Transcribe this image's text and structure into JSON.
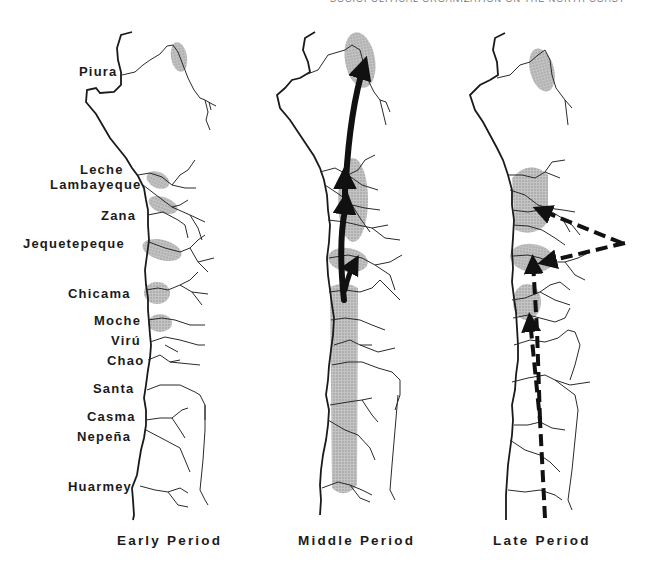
{
  "header": {
    "running_head": "SOCIOPOLITICAL ORGANIZATION ON THE NORTH COAST"
  },
  "map_panels": [
    {
      "id": "early",
      "label": "Early Period",
      "arrows": "none",
      "shaded_areas": [
        "Piura (upper valley)",
        "Leche",
        "Lambayeque",
        "Jequetepeque",
        "Chicama",
        "Moche"
      ]
    },
    {
      "id": "middle",
      "label": "Middle Period",
      "arrows": "solid, northward from Moche/Chicama to Jequetepeque, Lambayeque and Piura",
      "shaded_areas": [
        "Piura (upper valley)",
        "Lambayeque-Zana",
        "Jequetepeque",
        "Chicama through Huarmey (continuous strip)"
      ]
    },
    {
      "id": "late",
      "label": "Late Period",
      "arrows": "dashed, from highlands (east) to Lambayeque and Jequetepeque; from south (Huarmey) north to Chicama and Jequetepeque",
      "shaded_areas": [
        "Piura (upper valley)",
        "Leche-Lambayeque-Zana",
        "Jequetepeque",
        "Chicama"
      ]
    }
  ],
  "valleys": [
    {
      "name": "Piura"
    },
    {
      "name": "Leche"
    },
    {
      "name": "Lambayeque"
    },
    {
      "name": "Zana"
    },
    {
      "name": "Jequetepeque"
    },
    {
      "name": "Chicama"
    },
    {
      "name": "Moche"
    },
    {
      "name": "Virú"
    },
    {
      "name": "Chao"
    },
    {
      "name": "Santa"
    },
    {
      "name": "Casma"
    },
    {
      "name": "Nepeña"
    },
    {
      "name": "Huarmey"
    }
  ],
  "colors": {
    "coastline": "#1a1a1a",
    "river": "#2a2a2a",
    "shading": "#b8b8b8",
    "arrow": "#111111"
  }
}
